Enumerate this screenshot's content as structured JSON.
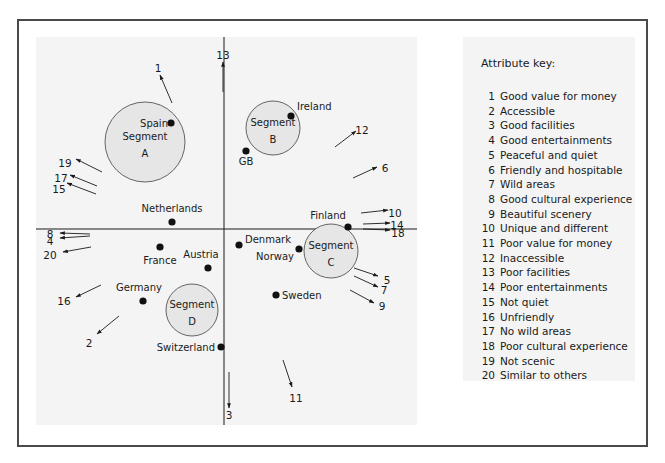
{
  "chart_data": {
    "type": "scatter",
    "title": "",
    "xlabel": "",
    "ylabel": "",
    "grid": false,
    "axes": {
      "origin_px": [
        224,
        229
      ]
    },
    "countries": [
      {
        "name": "Spain",
        "x": 171,
        "y": 123
      },
      {
        "name": "Ireland",
        "x": 291,
        "y": 116
      },
      {
        "name": "GB",
        "x": 246,
        "y": 151
      },
      {
        "name": "Netherlands",
        "x": 172,
        "y": 222
      },
      {
        "name": "France",
        "x": 160,
        "y": 247
      },
      {
        "name": "Austria",
        "x": 208,
        "y": 268
      },
      {
        "name": "Denmark",
        "x": 239,
        "y": 245
      },
      {
        "name": "Norway",
        "x": 299,
        "y": 249
      },
      {
        "name": "Finland",
        "x": 348,
        "y": 227
      },
      {
        "name": "Sweden",
        "x": 276,
        "y": 295
      },
      {
        "name": "Germany",
        "x": 143,
        "y": 301
      },
      {
        "name": "Switzerland",
        "x": 221,
        "y": 347
      }
    ],
    "segments": [
      {
        "name": "Segment A",
        "label_line1": "Segment",
        "label_line2": "A",
        "cx": 145,
        "cy": 142,
        "r": 40
      },
      {
        "name": "Segment B",
        "label_line1": "Segment",
        "label_line2": "B",
        "cx": 273,
        "cy": 128,
        "r": 27
      },
      {
        "name": "Segment C",
        "label_line1": "Segment",
        "label_line2": "C",
        "cx": 331,
        "cy": 251,
        "r": 27
      },
      {
        "name": "Segment D",
        "label_line1": "Segment",
        "label_line2": "D",
        "cx": 192,
        "cy": 310,
        "r": 26
      }
    ],
    "attribute_vectors": [
      {
        "id": 1,
        "x1": 172,
        "y1": 103,
        "x2": 160,
        "y2": 75,
        "lx": 158,
        "ly": 69
      },
      {
        "id": 2,
        "x1": 119,
        "y1": 316,
        "x2": 97,
        "y2": 334,
        "lx": 89,
        "ly": 344
      },
      {
        "id": 3,
        "x1": 229,
        "y1": 372,
        "x2": 229,
        "y2": 408,
        "lx": 229,
        "ly": 416
      },
      {
        "id": 4,
        "x1": 90,
        "y1": 236,
        "x2": 60,
        "y2": 238,
        "lx": 50,
        "ly": 242
      },
      {
        "id": 5,
        "x1": 354,
        "y1": 268,
        "x2": 378,
        "y2": 276,
        "lx": 387,
        "ly": 281
      },
      {
        "id": 6,
        "x1": 353,
        "y1": 178,
        "x2": 377,
        "y2": 167,
        "lx": 385,
        "ly": 169
      },
      {
        "id": 7,
        "x1": 354,
        "y1": 276,
        "x2": 378,
        "y2": 287,
        "lx": 384,
        "ly": 291
      },
      {
        "id": 8,
        "x1": 90,
        "y1": 234,
        "x2": 60,
        "y2": 233,
        "lx": 50,
        "ly": 235
      },
      {
        "id": 9,
        "x1": 350,
        "y1": 290,
        "x2": 374,
        "y2": 303,
        "lx": 382,
        "ly": 307
      },
      {
        "id": 10,
        "x1": 361,
        "y1": 213,
        "x2": 388,
        "y2": 210,
        "lx": 395,
        "ly": 214
      },
      {
        "id": 11,
        "x1": 283,
        "y1": 360,
        "x2": 292,
        "y2": 387,
        "lx": 296,
        "ly": 399
      },
      {
        "id": 12,
        "x1": 335,
        "y1": 147,
        "x2": 356,
        "y2": 131,
        "lx": 362,
        "ly": 131
      },
      {
        "id": 13,
        "x1": 223,
        "y1": 92,
        "x2": 223,
        "y2": 62,
        "lx": 223,
        "ly": 56
      },
      {
        "id": 14,
        "x1": 363,
        "y1": 224,
        "x2": 390,
        "y2": 223,
        "lx": 397,
        "ly": 226
      },
      {
        "id": 15,
        "x1": 96,
        "y1": 194,
        "x2": 67,
        "y2": 183,
        "lx": 59,
        "ly": 190
      },
      {
        "id": 16,
        "x1": 101,
        "y1": 285,
        "x2": 76,
        "y2": 297,
        "lx": 64,
        "ly": 302
      },
      {
        "id": 17,
        "x1": 97,
        "y1": 186,
        "x2": 70,
        "y2": 175,
        "lx": 61,
        "ly": 179
      },
      {
        "id": 18,
        "x1": 363,
        "y1": 229,
        "x2": 390,
        "y2": 230,
        "lx": 398,
        "ly": 234
      },
      {
        "id": 19,
        "x1": 102,
        "y1": 172,
        "x2": 76,
        "y2": 159,
        "lx": 65,
        "ly": 164
      },
      {
        "id": 20,
        "x1": 91,
        "y1": 247,
        "x2": 63,
        "y2": 252,
        "lx": 50,
        "ly": 256
      }
    ],
    "legend_position": "right"
  },
  "key": {
    "title": "Attribute key:",
    "items": [
      {
        "num": "1",
        "label": "Good value for money"
      },
      {
        "num": "2",
        "label": "Accessible"
      },
      {
        "num": "3",
        "label": "Good facilities"
      },
      {
        "num": "4",
        "label": "Good entertainments"
      },
      {
        "num": "5",
        "label": "Peaceful and quiet"
      },
      {
        "num": "6",
        "label": "Friendly and hospitable"
      },
      {
        "num": "7",
        "label": "Wild areas"
      },
      {
        "num": "8",
        "label": "Good cultural experience"
      },
      {
        "num": "9",
        "label": "Beautiful scenery"
      },
      {
        "num": "10",
        "label": "Unique and different"
      },
      {
        "num": "11",
        "label": "Poor value for money"
      },
      {
        "num": "12",
        "label": "Inaccessible"
      },
      {
        "num": "13",
        "label": "Poor facilities"
      },
      {
        "num": "14",
        "label": "Poor entertainments"
      },
      {
        "num": "15",
        "label": "Not quiet"
      },
      {
        "num": "16",
        "label": "Unfriendly"
      },
      {
        "num": "17",
        "label": "No wild areas"
      },
      {
        "num": "18",
        "label": "Poor cultural experience"
      },
      {
        "num": "19",
        "label": "Not scenic"
      },
      {
        "num": "20",
        "label": "Similar to others"
      }
    ]
  },
  "colors": {
    "panel_bg": "#f4f4f4",
    "segment_fill": "#e6e6e6",
    "ink": "#1a1a1a",
    "frame": "#4a4a4a"
  }
}
